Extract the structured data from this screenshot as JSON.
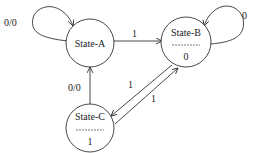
{
  "diagram": {
    "type": "state-machine",
    "states": [
      {
        "id": "A",
        "name": "State-A",
        "output": ""
      },
      {
        "id": "B",
        "name": "State-B",
        "output": "0"
      },
      {
        "id": "C",
        "name": "State-C",
        "output": "1"
      }
    ],
    "transitions": [
      {
        "from": "A",
        "to": "A",
        "label": "0/0"
      },
      {
        "from": "A",
        "to": "B",
        "label": "1"
      },
      {
        "from": "B",
        "to": "B",
        "label": "0"
      },
      {
        "from": "B",
        "to": "C",
        "label": "1"
      },
      {
        "from": "C",
        "to": "B",
        "label": "1"
      },
      {
        "from": "C",
        "to": "A",
        "label": "0/0"
      }
    ],
    "colors": {
      "stroke": "#333333",
      "text": "#222222",
      "background": "#ffffff"
    }
  }
}
